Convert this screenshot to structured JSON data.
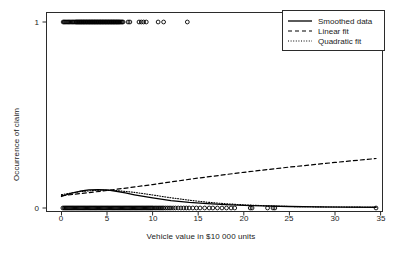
{
  "chart_data": {
    "type": "scatter",
    "title": "",
    "xlabel": "Vehicle value in $10 000 units",
    "ylabel": "Occurrence of claim",
    "xlim": [
      -0.9,
      36.0
    ],
    "ylim": [
      -0.06,
      1.06
    ],
    "xticks": [
      0,
      5,
      10,
      15,
      20,
      25,
      30,
      35
    ],
    "xtick_labels": [
      "0",
      "5",
      "10",
      "15",
      "20",
      "25",
      "30",
      "35"
    ],
    "yticks": [
      0,
      1
    ],
    "ytick_labels": [
      "0",
      "1"
    ],
    "grid": false,
    "frame": true,
    "legend_position": "top-right",
    "legend_entries": [
      {
        "label": "Smoothed data",
        "style": "solid",
        "color": "#000000"
      },
      {
        "label": "Linear fit",
        "style": "dashed",
        "color": "#000000"
      },
      {
        "label": "Quadratic fit",
        "style": "dotted",
        "color": "#000000"
      }
    ],
    "series": [
      {
        "name": "Occurrence of claim = 1",
        "type": "scatter",
        "marker": "open-circle",
        "y": 1,
        "x": [
          0.18,
          0.3,
          0.42,
          0.55,
          0.68,
          0.8,
          0.92,
          1.05,
          1.18,
          1.3,
          1.42,
          1.55,
          1.62,
          1.7,
          1.78,
          1.85,
          1.93,
          2.0,
          2.08,
          2.15,
          2.22,
          2.3,
          2.38,
          2.45,
          2.52,
          2.6,
          2.68,
          2.75,
          2.82,
          2.9,
          2.98,
          3.05,
          3.12,
          3.2,
          3.28,
          3.35,
          3.42,
          3.5,
          3.58,
          3.65,
          3.72,
          3.8,
          3.88,
          3.95,
          4.02,
          4.1,
          4.18,
          4.25,
          4.32,
          4.4,
          4.48,
          4.55,
          4.62,
          4.7,
          4.78,
          4.85,
          4.92,
          5.0,
          5.08,
          5.15,
          5.22,
          5.3,
          5.38,
          5.45,
          5.52,
          5.6,
          5.68,
          5.75,
          5.82,
          5.9,
          5.98,
          6.05,
          6.12,
          6.2,
          6.28,
          6.35,
          6.45,
          6.55,
          6.65,
          6.75,
          7.3,
          7.5,
          8.5,
          8.75,
          9.0,
          9.3,
          10.6,
          11.2,
          13.8
        ]
      },
      {
        "name": "Occurrence of claim = 0",
        "type": "scatter",
        "marker": "open-circle",
        "y": 0,
        "x": [
          0.15,
          0.28,
          0.4,
          0.52,
          0.64,
          0.76,
          0.88,
          1.0,
          1.12,
          1.24,
          1.36,
          1.48,
          1.6,
          1.72,
          1.84,
          1.96,
          2.08,
          2.2,
          2.32,
          2.44,
          2.56,
          2.68,
          2.8,
          2.92,
          3.04,
          3.16,
          3.28,
          3.4,
          3.52,
          3.64,
          3.76,
          3.88,
          4.0,
          4.12,
          4.24,
          4.36,
          4.48,
          4.6,
          4.72,
          4.84,
          4.96,
          5.08,
          5.2,
          5.32,
          5.44,
          5.56,
          5.68,
          5.8,
          5.92,
          6.04,
          6.16,
          6.28,
          6.4,
          6.52,
          6.64,
          6.76,
          6.88,
          7.0,
          7.12,
          7.24,
          7.36,
          7.48,
          7.6,
          7.72,
          7.84,
          7.96,
          8.08,
          8.2,
          8.32,
          8.44,
          8.56,
          8.68,
          8.8,
          8.92,
          9.04,
          9.16,
          9.28,
          9.4,
          9.52,
          9.64,
          9.76,
          9.88,
          10.0,
          10.15,
          10.3,
          10.45,
          10.6,
          10.75,
          10.9,
          11.05,
          11.2,
          11.4,
          11.6,
          11.8,
          12.0,
          12.25,
          12.5,
          12.8,
          13.1,
          13.4,
          13.7,
          14.0,
          14.4,
          14.8,
          15.2,
          15.7,
          16.2,
          16.6,
          17.1,
          17.6,
          18.1,
          18.6,
          19.0,
          20.7,
          20.9,
          22.6,
          23.2,
          23.4,
          34.5
        ]
      },
      {
        "name": "Smoothed data",
        "type": "line",
        "style": "solid",
        "x": [
          0,
          1,
          2,
          3,
          4,
          5,
          6,
          7,
          8,
          9,
          10,
          12,
          14,
          16,
          18,
          20,
          22,
          25,
          28,
          31,
          34.5
        ],
        "y": [
          0.062,
          0.078,
          0.09,
          0.097,
          0.099,
          0.097,
          0.09,
          0.081,
          0.071,
          0.062,
          0.054,
          0.04,
          0.03,
          0.023,
          0.018,
          0.014,
          0.011,
          0.008,
          0.006,
          0.005,
          0.004
        ]
      },
      {
        "name": "Linear fit",
        "type": "line",
        "style": "dashed",
        "x": [
          0,
          5,
          10,
          15,
          20,
          25,
          30,
          34.5
        ],
        "y": [
          0.066,
          0.094,
          0.126,
          0.161,
          0.192,
          0.22,
          0.245,
          0.266
        ]
      },
      {
        "name": "Quadratic fit",
        "type": "line",
        "style": "dotted",
        "x": [
          0,
          2,
          4,
          6,
          8,
          10,
          12,
          14,
          16,
          18,
          20,
          22,
          25,
          28,
          31,
          34.5
        ],
        "y": [
          0.072,
          0.088,
          0.096,
          0.094,
          0.084,
          0.07,
          0.055,
          0.042,
          0.031,
          0.023,
          0.017,
          0.013,
          0.008,
          0.006,
          0.005,
          0.004
        ]
      }
    ]
  }
}
